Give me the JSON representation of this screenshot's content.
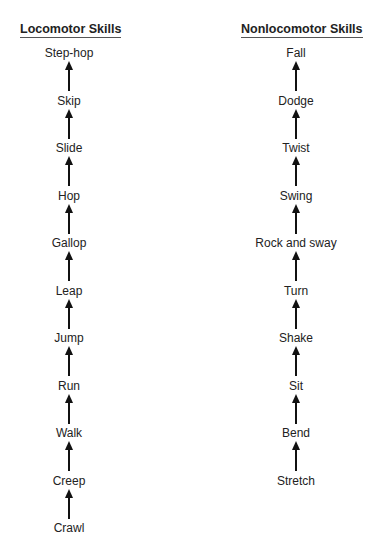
{
  "left": {
    "title": "Locomotor Skills",
    "items": [
      "Step-hop",
      "Skip",
      "Slide",
      "Hop",
      "Gallop",
      "Leap",
      "Jump",
      "Run",
      "Walk",
      "Creep",
      "Crawl"
    ]
  },
  "right": {
    "title": "Nonlocomotor Skills",
    "items": [
      "Fall",
      "Dodge",
      "Twist",
      "Swing",
      "Rock and sway",
      "Turn",
      "Shake",
      "Sit",
      "Bend",
      "Stretch"
    ]
  }
}
